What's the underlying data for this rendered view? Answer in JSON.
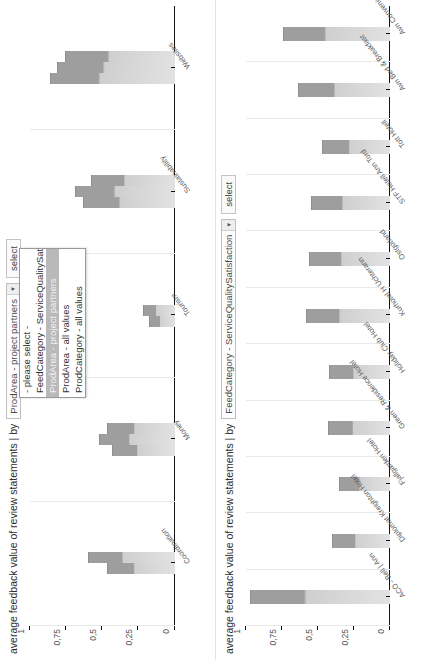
{
  "top_panel": {
    "title": "average feedback value of review statements | by",
    "dim_combo": {
      "value": "ProdArea - project partners",
      "arrow": "▼"
    },
    "select_button": "select",
    "dropdown": {
      "open": true,
      "options": [
        "- please select -",
        "FeedCategory - ServiceQualitySatisfaction",
        "ProdArea - project partners",
        "ProdArea - all values",
        "ProdCategory - all values"
      ],
      "selected_index": 2
    },
    "legend_prefix": "= Copperhill Mountain Lodge   = Holiday Club H"
  },
  "bottom_panel": {
    "title": "average feedback value of review statements | by",
    "dim_combo": {
      "value": "FeedCategory - ServiceQualitySatisfaction",
      "arrow": "▼"
    },
    "select_button": "select"
  },
  "chart_data": [
    {
      "type": "bar",
      "title": "average feedback value of review statements | by ProdArea - project partners",
      "xlabel": "",
      "ylabel": "",
      "ylim": [
        0,
        1
      ],
      "yticks": [
        "0",
        "0,25",
        "0,5",
        "0,75",
        "1"
      ],
      "grid": true,
      "legend_position": "top",
      "categories": [
        "Coordination",
        "Money",
        "Tourism",
        "Sustainability",
        "Websites"
      ],
      "series": [
        {
          "name": "Copperhill Mountain Lodge",
          "values": [
            0.47,
            0.43,
            0.18,
            0.63,
            0.86
          ]
        },
        {
          "name": "Holiday Club H",
          "values": [
            0.6,
            0.52,
            0.22,
            0.69,
            0.81
          ]
        },
        {
          "name": "series-3",
          "values": [
            0.0,
            0.47,
            0.0,
            0.58,
            0.76
          ]
        }
      ]
    },
    {
      "type": "bar",
      "title": "average feedback value of review statements | by FeedCategory - ServiceQualitySatisfaction",
      "xlabel": "",
      "ylabel": "",
      "ylim": [
        0,
        1
      ],
      "yticks": [
        "0",
        "0,25",
        "0,5",
        "0,75",
        "1"
      ],
      "grid": true,
      "legend_position": "top",
      "categories": [
        "ACO - Bell | Ann",
        "Diplomat Kreighton Hotel",
        "Fjallgarden Hotel",
        "Green & Residence Hotel",
        "Holiday Club Hotel",
        "Kurhotel H Uchterann",
        "Ostgotland",
        "STF Hotell Ann Tord",
        "Tott Hotell",
        "Avn Bed & Breakfast",
        "Avn Convenience Inn"
      ],
      "values": [
        0.97,
        0.4,
        0.35,
        0.43,
        0.42,
        0.58,
        0.56,
        0.55,
        0.47,
        0.64,
        0.74
      ]
    }
  ]
}
